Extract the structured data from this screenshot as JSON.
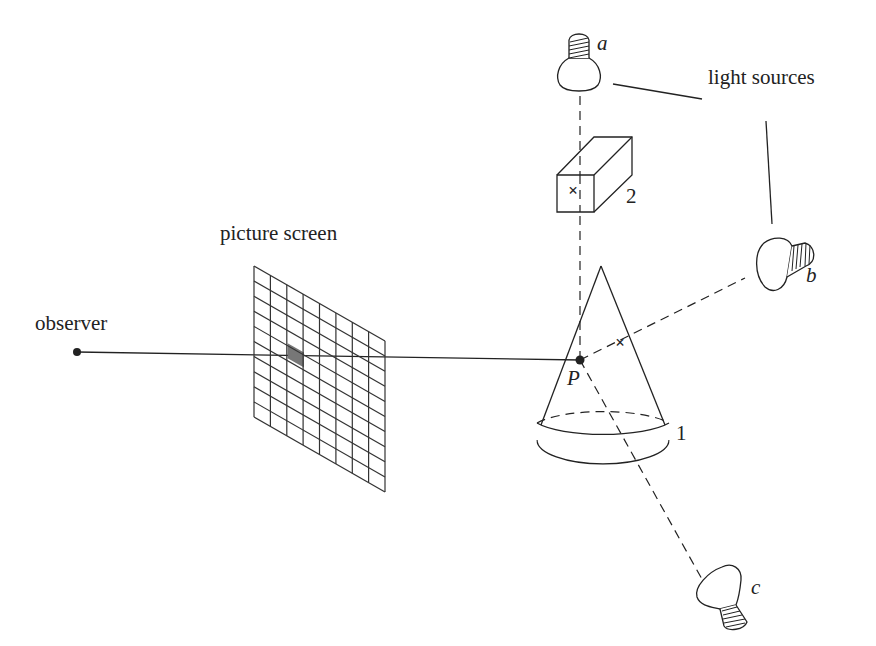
{
  "diagram": {
    "labels": {
      "observer": "observer",
      "picture_screen": "picture screen",
      "light_sources": "light sources",
      "point_p": "P",
      "light_a": "a",
      "light_b": "b",
      "light_c": "c",
      "object_1": "1",
      "object_2": "2"
    },
    "screen_grid": {
      "columns": 8,
      "rows": 10,
      "shaded_cell": {
        "column": 2,
        "row": 4
      }
    },
    "objects": [
      {
        "id": "1",
        "shape": "cone"
      },
      {
        "id": "2",
        "shape": "box"
      }
    ],
    "light_sources": [
      {
        "id": "a",
        "position": "top",
        "shadow_ray_blocked_by": "2"
      },
      {
        "id": "b",
        "position": "right",
        "shadow_ray_blocked_by": "1"
      },
      {
        "id": "c",
        "position": "bottom-right",
        "shadow_ray_blocked_by": null
      }
    ],
    "colors": {
      "ink": "#222222",
      "shaded_pixel": "#777777",
      "background": "#ffffff"
    }
  }
}
